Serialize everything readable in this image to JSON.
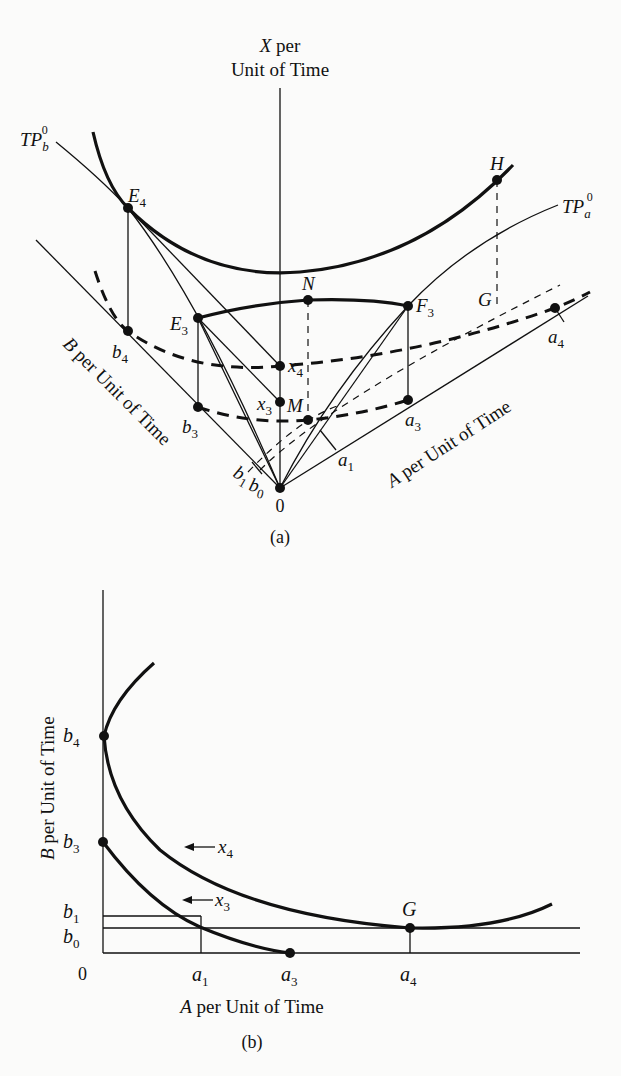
{
  "figure_a": {
    "caption": "(a)",
    "axis_x_label_line1": "X per",
    "axis_x_label_line2": "Unit of Time",
    "axis_b_label": "B per Unit of Time",
    "axis_a_label": "A per Unit of Time",
    "origin": "0",
    "curves": {
      "tp_b": {
        "base": "TP",
        "sub": "b",
        "sup": "0"
      },
      "tp_a": {
        "base": "TP",
        "sub": "a",
        "sup": "0"
      }
    },
    "points": {
      "E4": {
        "base": "E",
        "sub": "4"
      },
      "H": {
        "base": "H"
      },
      "E3": {
        "base": "E",
        "sub": "3"
      },
      "N": {
        "base": "N"
      },
      "F3": {
        "base": "F",
        "sub": "3"
      },
      "G": {
        "base": "G"
      },
      "b4": {
        "base": "b",
        "sub": "4"
      },
      "b3": {
        "base": "b",
        "sub": "3"
      },
      "x4": {
        "base": "x",
        "sub": "4"
      },
      "x3": {
        "base": "x",
        "sub": "3"
      },
      "M": {
        "base": "M"
      },
      "a3": {
        "base": "a",
        "sub": "3"
      },
      "a4": {
        "base": "a",
        "sub": "4"
      },
      "a1": {
        "base": "a",
        "sub": "1"
      },
      "b1": {
        "base": "b",
        "sub": "1"
      },
      "b0": {
        "base": "b",
        "sub": "0"
      }
    }
  },
  "figure_b": {
    "caption": "(b)",
    "y_axis_label": "B per Unit of Time",
    "x_axis_label": "A per Unit of Time",
    "origin": "0",
    "y_ticks": [
      {
        "base": "b",
        "sub": "4"
      },
      {
        "base": "b",
        "sub": "3"
      },
      {
        "base": "b",
        "sub": "1"
      },
      {
        "base": "b",
        "sub": "0"
      }
    ],
    "x_ticks": [
      {
        "base": "a",
        "sub": "1"
      },
      {
        "base": "a",
        "sub": "3"
      },
      {
        "base": "a",
        "sub": "4"
      }
    ],
    "curve_labels": [
      {
        "base": "x",
        "sub": "4"
      },
      {
        "base": "x",
        "sub": "3"
      }
    ],
    "point_G": "G"
  }
}
